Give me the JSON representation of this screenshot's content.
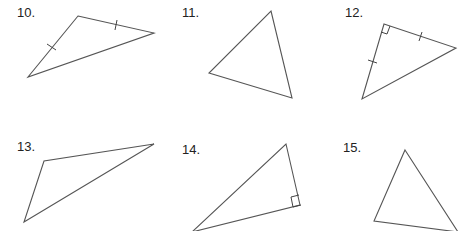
{
  "problems": [
    {
      "number": "10.",
      "marks": "two congruent sides (tick marks)"
    },
    {
      "number": "11.",
      "marks": "none"
    },
    {
      "number": "12.",
      "marks": "right angle, two congruent legs (tick marks)"
    },
    {
      "number": "13.",
      "marks": "none"
    },
    {
      "number": "14.",
      "marks": "right angle"
    },
    {
      "number": "15.",
      "marks": "none"
    }
  ],
  "colors": {
    "stroke": "#555555",
    "text": "#222222",
    "background": "#ffffff"
  }
}
